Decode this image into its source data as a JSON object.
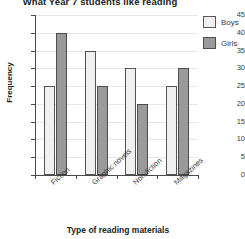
{
  "chart_data": {
    "type": "bar",
    "title": "What Year 7 students like reading",
    "xlabel": "Type of reading materials",
    "ylabel": "Frequency",
    "categories": [
      "Fiction",
      "Graphic novels",
      "Non-fiction",
      "Magazines"
    ],
    "series": [
      {
        "name": "Boys",
        "values": [
          25,
          35,
          30,
          25
        ],
        "color": "#f0f0f0"
      },
      {
        "name": "Girls",
        "values": [
          40,
          25,
          20,
          30
        ],
        "color": "#9a9a9a"
      }
    ],
    "ylim": [
      0,
      45
    ],
    "ytick_labels": [
      "0",
      "5",
      "10",
      "15",
      "20",
      "25",
      "30",
      "35",
      "40",
      "45"
    ],
    "ytick_step": 5,
    "grid": true,
    "legend_position": "right"
  }
}
